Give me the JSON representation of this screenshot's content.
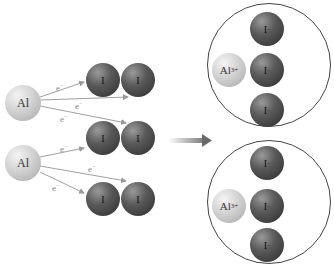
{
  "diagram": {
    "type": "electron transfer / ionic bond formation",
    "reactants": {
      "aluminum_atoms": [
        {
          "label": "Al",
          "electrons": [
            "e⁻",
            "e⁻",
            "e⁻"
          ]
        },
        {
          "label": "Al",
          "electrons": [
            "e⁻",
            "e⁻",
            "e⁻"
          ]
        }
      ],
      "iodine_molecules": [
        {
          "atoms": [
            "I",
            "I"
          ]
        },
        {
          "atoms": [
            "I",
            "I"
          ]
        },
        {
          "atoms": [
            "I",
            "I"
          ]
        }
      ],
      "electron_label": "e",
      "electron_charge": "−"
    },
    "arrow": "reaction-arrow",
    "products": [
      {
        "cation": {
          "symbol": "Al",
          "charge": "3+"
        },
        "anions": [
          {
            "symbol": "I",
            "charge": "−"
          },
          {
            "symbol": "I",
            "charge": "−"
          },
          {
            "symbol": "I",
            "charge": "−"
          }
        ]
      },
      {
        "cation": {
          "symbol": "Al",
          "charge": "3+"
        },
        "anions": [
          {
            "symbol": "I",
            "charge": "−"
          },
          {
            "symbol": "I",
            "charge": "−"
          },
          {
            "symbol": "I",
            "charge": "−"
          }
        ]
      }
    ]
  }
}
